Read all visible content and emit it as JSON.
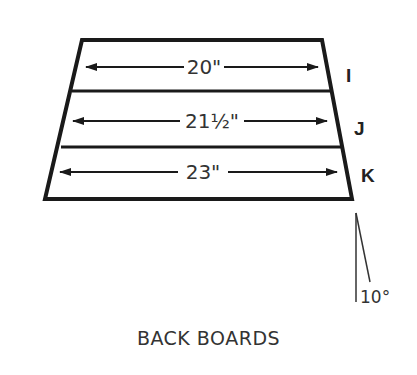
{
  "diagram": {
    "title": "BACK BOARDS",
    "boards": [
      {
        "label": "I",
        "length": "20\""
      },
      {
        "label": "J",
        "length": "21½\""
      },
      {
        "label": "K",
        "length": "23\""
      }
    ],
    "angle": "10°",
    "colors": {
      "line": "#1a1a1a",
      "text": "#333333"
    }
  }
}
